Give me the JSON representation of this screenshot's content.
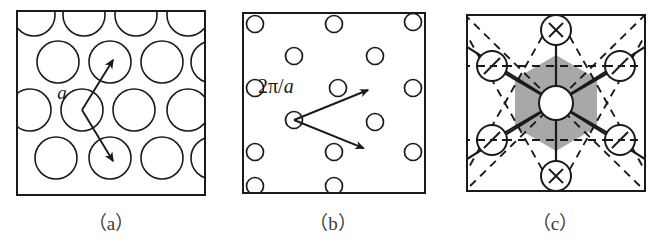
{
  "figure": {
    "panels": [
      {
        "id": "a",
        "caption": "（a）",
        "label": "a",
        "kind": "real-space-lattice",
        "description": "triangular lattice of large open circles with two basis vectors",
        "frame": {
          "x": 16,
          "y": 10,
          "width": 190,
          "height": 186
        },
        "circle_radius": 21,
        "stroke": "#1a1a1a",
        "stroke_width": 1.6,
        "circle_centers": [
          [
            34,
            15
          ],
          [
            84,
            15
          ],
          [
            136,
            15
          ],
          [
            188,
            15
          ],
          [
            58,
            62
          ],
          [
            110,
            62
          ],
          [
            162,
            62
          ],
          [
            210,
            62
          ],
          [
            30,
            110
          ],
          [
            82,
            110
          ],
          [
            134,
            110
          ],
          [
            188,
            110
          ],
          [
            56,
            158
          ],
          [
            110,
            158
          ],
          [
            162,
            158
          ],
          [
            210,
            158
          ]
        ],
        "origin": [
          82,
          110
        ],
        "arrows": [
          {
            "from": [
              82,
              110
            ],
            "to": [
              112,
              60
            ]
          },
          {
            "from": [
              82,
              110
            ],
            "to": [
              112,
              160
            ]
          }
        ],
        "label_pos": [
          62,
          96
        ]
      },
      {
        "id": "b",
        "caption": "（b）",
        "label": "2π/a",
        "label_numerator": "2π",
        "label_slash": "/",
        "label_denominator": "a",
        "kind": "reciprocal-lattice",
        "description": "triangular reciprocal lattice of small open circles with two reciprocal basis vectors",
        "frame": {
          "x": 20,
          "y": 12,
          "width": 184,
          "height": 182
        },
        "circle_radius": 8.5,
        "stroke": "#1a1a1a",
        "stroke_width": 1.6,
        "circle_centers": [
          [
            33,
            24
          ],
          [
            112,
            24
          ],
          [
            191,
            24
          ],
          [
            72,
            56
          ],
          [
            151,
            56
          ],
          [
            33,
            88
          ],
          [
            112,
            88
          ],
          [
            191,
            88
          ],
          [
            72,
            120
          ],
          [
            151,
            120
          ],
          [
            33,
            152
          ],
          [
            112,
            152
          ],
          [
            191,
            152
          ],
          [
            72,
            184
          ],
          [
            151,
            184
          ]
        ],
        "origin": [
          72,
          120
        ],
        "arrows": [
          {
            "from": [
              72,
              120
            ],
            "to": [
              146,
              90
            ]
          },
          {
            "from": [
              72,
              120
            ],
            "to": [
              146,
              152
            ]
          }
        ],
        "label_pos": [
          36,
          92
        ]
      },
      {
        "id": "c",
        "caption": "（c）",
        "kind": "brillouin-zone",
        "description": "first Brillouin zone: shaded hexagon, central open circle, six spokes, six satellite circles marked by crossing construction lines",
        "frame": {
          "x": 22,
          "y": 14,
          "width": 180,
          "height": 178
        },
        "stroke": "#1a1a1a",
        "hex_fill": "#a8a8a8",
        "center": [
          112,
          103
        ],
        "center_circle_radius": 17,
        "hexagon_radius": 48,
        "satellite_radius": 15,
        "satellites": [
          {
            "pos": [
              112,
              30
            ],
            "mark": "x"
          },
          {
            "pos": [
              48,
              66
            ],
            "mark": "slash"
          },
          {
            "pos": [
              176,
              66
            ],
            "mark": "slash"
          },
          {
            "pos": [
              48,
              140
            ],
            "mark": "slash"
          },
          {
            "pos": [
              176,
              140
            ],
            "mark": "slash"
          },
          {
            "pos": [
              112,
              176
            ],
            "mark": "x"
          }
        ]
      }
    ]
  }
}
